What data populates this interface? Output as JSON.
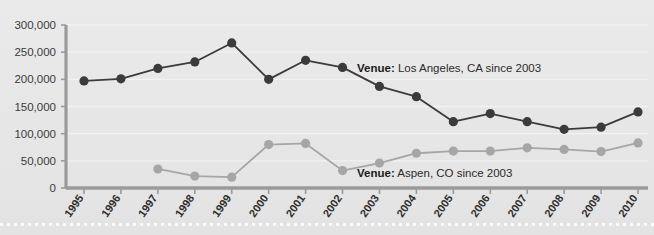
{
  "chart_data": {
    "type": "line",
    "title": "",
    "xlabel": "",
    "ylabel": "",
    "ylim": [
      0,
      300000
    ],
    "yticks": [
      0,
      50000,
      100000,
      150000,
      200000,
      250000,
      300000
    ],
    "ytick_labels": [
      "0",
      "50,000",
      "100,000",
      "150,000",
      "200,000",
      "250,000",
      "300,000"
    ],
    "grid": true,
    "legend_position": "inline-annotation",
    "categories": [
      "1995",
      "1996",
      "1997",
      "1998",
      "1999",
      "2000",
      "2001",
      "2002",
      "2003",
      "2004",
      "2005",
      "2006",
      "2007",
      "2008",
      "2009",
      "2010"
    ],
    "series": [
      {
        "name": "Los Angeles, CA",
        "color": "#3b3b3b",
        "values": [
          197000,
          201000,
          220000,
          232000,
          267000,
          200000,
          235000,
          222000,
          187000,
          168000,
          122000,
          137000,
          122000,
          108000,
          112000,
          140000
        ]
      },
      {
        "name": "Aspen, CO",
        "color": "#a6a6a6",
        "values": [
          null,
          null,
          35000,
          22000,
          20000,
          80000,
          82000,
          32000,
          46000,
          64000,
          68000,
          68000,
          74000,
          71000,
          67000,
          83000
        ]
      }
    ],
    "annotations": [
      {
        "label": "Venue:",
        "value": "Los Angeles, CA since 2003",
        "x": 357,
        "y": 62,
        "series": "Los Angeles, CA"
      },
      {
        "label": "Venue:",
        "value": "Aspen, CO since 2003",
        "x": 357,
        "y": 167,
        "series": "Aspen, CO"
      }
    ],
    "colors": {
      "dark_series": "#3b3b3b",
      "light_series": "#a6a6a6",
      "axis": "#9a9a9a",
      "background": "#e8e8e8",
      "gridline": "#f2f2f2",
      "tick_text": "#2e2e2e"
    }
  }
}
